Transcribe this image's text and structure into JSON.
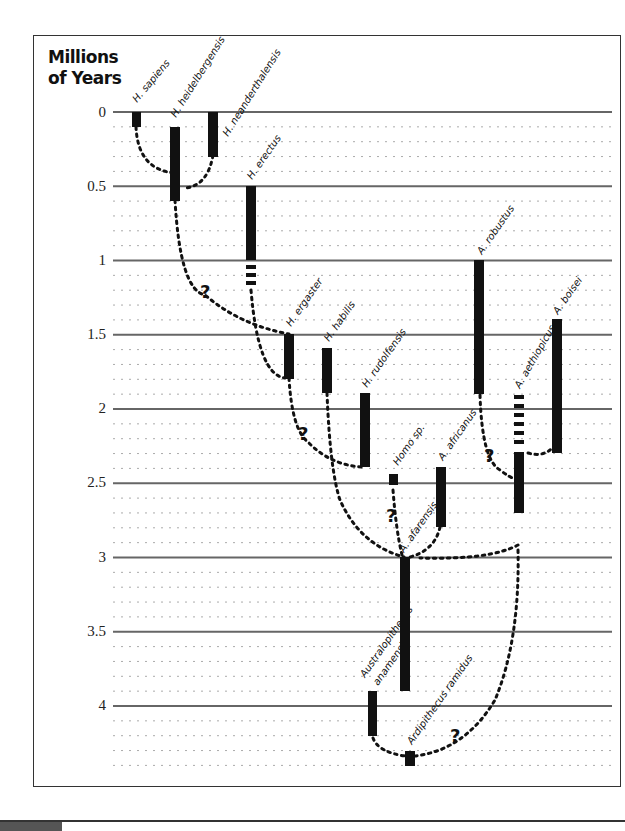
{
  "chart_data": {
    "type": "timeline-phylogeny",
    "title": "Millions of Years",
    "title_lines": [
      "Millions",
      "of Years"
    ],
    "ylabel": "Millions of Years",
    "ylim": [
      0,
      4.4
    ],
    "y_ticks": [
      "0",
      "0.5",
      "1",
      "1.5",
      "2",
      "2.5",
      "3",
      "3.5",
      "4"
    ],
    "grid": {
      "major_every": 0.5,
      "minor_every": 0.1,
      "minor_style": "dotted"
    },
    "species": [
      {
        "name": "H. sapiens",
        "start": 0.0,
        "end": 0.1
      },
      {
        "name": "H. heidelbergensis",
        "start": 0.1,
        "end": 0.6
      },
      {
        "name": "H. neanderthalensis",
        "start": 0.0,
        "end": 0.3
      },
      {
        "name": "H. erectus",
        "start": 0.5,
        "end": 1.0,
        "uncertain_until": 1.2
      },
      {
        "name": "H. ergaster",
        "start": 1.5,
        "end": 1.8
      },
      {
        "name": "H. habilis",
        "start": 1.6,
        "end": 1.9
      },
      {
        "name": "H. rudolfensis",
        "start": 1.9,
        "end": 2.4
      },
      {
        "name": "Homo sp.",
        "start": 2.45,
        "end": 2.5
      },
      {
        "name": "A. africanus",
        "start": 2.4,
        "end": 2.8
      },
      {
        "name": "A. afarensis",
        "start": 3.0,
        "end": 3.9
      },
      {
        "name": "A. robustus",
        "start": 1.0,
        "end": 1.9
      },
      {
        "name": "A. aethiopicus",
        "start": 2.3,
        "end": 2.7,
        "uncertain_from": 1.9
      },
      {
        "name": "A. boisei",
        "start": 1.4,
        "end": 2.3
      },
      {
        "name": "Australopithecus anamensis",
        "start": 3.9,
        "end": 4.2
      },
      {
        "name": "Ardipithecus ramidus",
        "start": 4.3,
        "end": 4.4
      }
    ],
    "uncertain_links_marker": "?",
    "question_marks": 5
  },
  "labels": {
    "ticks": [
      "0",
      "0.5",
      "1",
      "1.5",
      "2",
      "2.5",
      "3",
      "3.5",
      "4"
    ],
    "species": {
      "sapiens": "H. sapiens",
      "heidelbergensis": "H. heidelbergensis",
      "neanderthalensis": "H. neanderthalensis",
      "erectus": "H. erectus",
      "ergaster": "H. ergaster",
      "habilis": "H. habilis",
      "rudolfensis": "H. rudolfensis",
      "homo_sp": "Homo sp.",
      "africanus": "A. africanus",
      "afarensis": "A. afarensis",
      "robustus": "A. robustus",
      "aethiopicus": "A. aethiopicus",
      "boisei": "A. boisei",
      "anamensis_1": "Australopithecus",
      "anamensis_2": "anamensis",
      "ramidus": "Ardipithecus ramidus"
    },
    "question": "?"
  },
  "colors": {
    "bar": "#111111",
    "major_line": "#666666",
    "minor_line": "#aaaaaa",
    "frame": "#333333"
  }
}
